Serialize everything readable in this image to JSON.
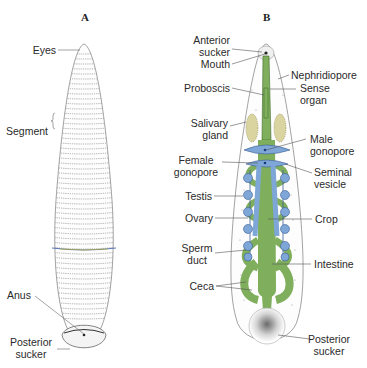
{
  "panels": {
    "a": {
      "letter": "A",
      "labels": {
        "eyes": "Eyes",
        "segment": "Segment",
        "anus": "Anus",
        "posterior_sucker_1": "Posterior",
        "posterior_sucker_2": "sucker"
      }
    },
    "b": {
      "letter": "B",
      "labels": {
        "anterior_sucker_1": "Anterior",
        "anterior_sucker_2": "sucker",
        "mouth": "Mouth",
        "nephridiopore": "Nephridiopore",
        "proboscis": "Proboscis",
        "sense_organ_1": "Sense",
        "sense_organ_2": "organ",
        "salivary_gland_1": "Salivary",
        "salivary_gland_2": "gland",
        "male_gonopore_1": "Male",
        "male_gonopore_2": "gonopore",
        "female_gonopore_1": "Female",
        "female_gonopore_2": "gonopore",
        "seminal_vesicle_1": "Seminal",
        "seminal_vesicle_2": "vesicle",
        "testis": "Testis",
        "ovary": "Ovary",
        "crop": "Crop",
        "sperm_duct_1": "Sperm",
        "sperm_duct_2": "duct",
        "intestine": "Intestine",
        "ceca": "Ceca",
        "posterior_sucker_1": "Posterior",
        "posterior_sucker_2": "sucker"
      }
    }
  },
  "colors": {
    "gut_green": "#7fae5c",
    "reproductive_blue": "#7ea7d8",
    "body_outline": "#9a9a9a"
  }
}
